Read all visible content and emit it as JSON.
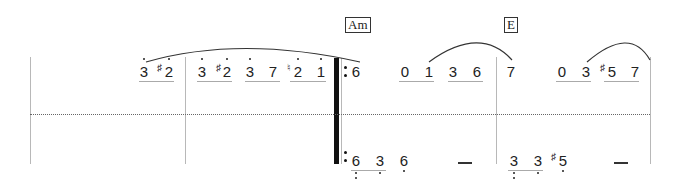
{
  "chords": [
    {
      "label": "Am",
      "x": 345,
      "y": 17
    },
    {
      "label": "E",
      "x": 504,
      "y": 17
    }
  ],
  "upper_staff": {
    "notes": [
      {
        "id": "u1",
        "digit": "3",
        "x": 138,
        "accidental": null,
        "octave_up": 1
      },
      {
        "id": "u2",
        "digit": "2",
        "x": 160,
        "accidental": "♯",
        "octave_up": 1
      },
      {
        "id": "u3",
        "digit": "3",
        "x": 196,
        "accidental": null,
        "octave_up": 1
      },
      {
        "id": "u4",
        "digit": "2",
        "x": 218,
        "accidental": "♯",
        "octave_up": 1
      },
      {
        "id": "u5",
        "digit": "3",
        "x": 244,
        "accidental": null,
        "octave_up": 1
      },
      {
        "id": "u6",
        "digit": "7",
        "x": 266,
        "accidental": null,
        "octave_up": 0
      },
      {
        "id": "u7",
        "digit": "2",
        "x": 290,
        "accidental": "♮",
        "octave_up": 1
      },
      {
        "id": "u8",
        "digit": "1",
        "x": 314,
        "accidental": null,
        "octave_up": 1
      },
      {
        "id": "u9",
        "digit": "6",
        "x": 350,
        "accidental": null,
        "octave_up": 0
      },
      {
        "id": "u10",
        "digit": "0",
        "x": 399,
        "accidental": null,
        "octave_up": 0
      },
      {
        "id": "u11",
        "digit": "1",
        "x": 423,
        "accidental": null,
        "octave_up": 0
      },
      {
        "id": "u12",
        "digit": "3",
        "x": 447,
        "accidental": null,
        "octave_up": 0
      },
      {
        "id": "u13",
        "digit": "6",
        "x": 471,
        "accidental": null,
        "octave_up": 0
      },
      {
        "id": "u14",
        "digit": "7",
        "x": 505,
        "accidental": null,
        "octave_up": 0
      },
      {
        "id": "u15",
        "digit": "0",
        "x": 556,
        "accidental": null,
        "octave_up": 0
      },
      {
        "id": "u16",
        "digit": "3",
        "x": 580,
        "accidental": null,
        "octave_up": 0
      },
      {
        "id": "u17",
        "digit": "5",
        "x": 605,
        "accidental": "♯",
        "octave_up": 0
      },
      {
        "id": "u18",
        "digit": "7",
        "x": 629,
        "accidental": null,
        "octave_up": 0
      }
    ]
  },
  "lower_staff": {
    "notes": [
      {
        "id": "l1",
        "digit": "6",
        "x": 350,
        "accidental": null,
        "octave_down": 2
      },
      {
        "id": "l2",
        "digit": "3",
        "x": 373,
        "accidental": null,
        "octave_down": 1
      },
      {
        "id": "l3",
        "digit": "6",
        "x": 398,
        "accidental": null,
        "octave_down": 1
      },
      {
        "id": "l4",
        "digit": "3",
        "x": 508,
        "accidental": null,
        "octave_down": 2
      },
      {
        "id": "l5",
        "digit": "3",
        "x": 533,
        "accidental": null,
        "octave_down": 1
      },
      {
        "id": "l6",
        "digit": "5",
        "x": 557,
        "accidental": "♯",
        "octave_down": 1
      }
    ],
    "dashes": [
      {
        "x": 458,
        "width": 14
      },
      {
        "x": 614,
        "width": 14
      }
    ]
  },
  "barlines": [
    30,
    185,
    496,
    650
  ],
  "repeat_bar_x": 336
}
